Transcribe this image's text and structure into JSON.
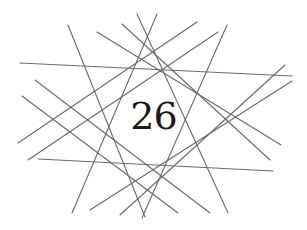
{
  "chapter": {
    "number": "26"
  },
  "ornament": {
    "name": "crossed-lines-star",
    "line_color": "#6a6a6a",
    "lines": [
      {
        "x1": 20,
        "y1": 63,
        "x2": 292,
        "y2": 76
      },
      {
        "x1": 38,
        "y1": 159,
        "x2": 273,
        "y2": 171
      },
      {
        "x1": 68,
        "y1": 25,
        "x2": 145,
        "y2": 217
      },
      {
        "x1": 227,
        "y1": 25,
        "x2": 142,
        "y2": 218
      },
      {
        "x1": 137,
        "y1": 14,
        "x2": 228,
        "y2": 213
      },
      {
        "x1": 157,
        "y1": 14,
        "x2": 72,
        "y2": 213
      },
      {
        "x1": 97,
        "y1": 32,
        "x2": 281,
        "y2": 145
      },
      {
        "x1": 122,
        "y1": 24,
        "x2": 270,
        "y2": 160
      },
      {
        "x1": 35,
        "y1": 80,
        "x2": 210,
        "y2": 213
      },
      {
        "x1": 22,
        "y1": 96,
        "x2": 178,
        "y2": 213
      },
      {
        "x1": 292,
        "y1": 81,
        "x2": 90,
        "y2": 210
      },
      {
        "x1": 285,
        "y1": 65,
        "x2": 120,
        "y2": 215
      },
      {
        "x1": 218,
        "y1": 32,
        "x2": 28,
        "y2": 160
      },
      {
        "x1": 197,
        "y1": 22,
        "x2": 18,
        "y2": 143
      }
    ]
  }
}
